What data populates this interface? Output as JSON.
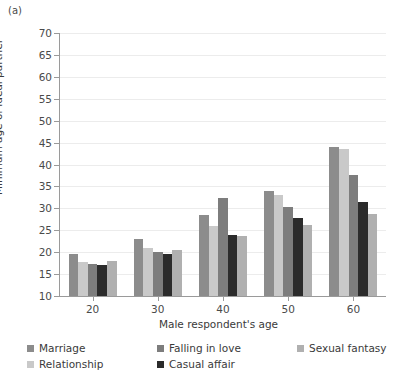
{
  "panel_label": "(a)",
  "chart_data": {
    "type": "bar",
    "title": "",
    "subtitle": "",
    "xlabel": "Male respondent's age",
    "ylabel": "Minimum age of ideal partner",
    "categories": [
      "20",
      "30",
      "40",
      "50",
      "60"
    ],
    "ylim": [
      10,
      70
    ],
    "ytick_step": 5,
    "yticks": [
      10,
      15,
      20,
      25,
      30,
      35,
      40,
      45,
      50,
      55,
      60,
      65,
      70
    ],
    "ytick_labels": [
      "10",
      "15",
      "20",
      "25",
      "30",
      "35",
      "40",
      "45",
      "50",
      "55",
      "60",
      "65",
      "70"
    ],
    "grid": true,
    "grid_axis": "y",
    "legend_position": "bottom-left",
    "legend_columns": 3,
    "series": [
      {
        "name": "Marriage",
        "color": "#8c8c8c",
        "bar_order": 1,
        "values": [
          19.5,
          23.0,
          28.5,
          34.0,
          44.0
        ]
      },
      {
        "name": "Relationship",
        "color": "#c9c9c9",
        "bar_order": 2,
        "values": [
          17.8,
          21.0,
          26.0,
          33.0,
          43.5
        ]
      },
      {
        "name": "Falling in love",
        "color": "#7d7d7d",
        "bar_order": 3,
        "values": [
          17.4,
          20.0,
          32.3,
          30.3,
          37.5
        ]
      },
      {
        "name": "Casual affair",
        "color": "#2b2b2b",
        "bar_order": 4,
        "values": [
          17.0,
          19.5,
          24.0,
          27.8,
          31.5
        ]
      },
      {
        "name": "Sexual fantasy",
        "color": "#b0b0b0",
        "bar_order": 5,
        "values": [
          18.0,
          20.6,
          23.6,
          26.2,
          28.8
        ]
      }
    ],
    "legend_entries": [
      {
        "label": "Marriage",
        "color": "#8c8c8c"
      },
      {
        "label": "Falling in love",
        "color": "#7d7d7d"
      },
      {
        "label": "Sexual fantasy",
        "color": "#b0b0b0"
      },
      {
        "label": "Relationship",
        "color": "#c9c9c9"
      },
      {
        "label": "Casual affair",
        "color": "#2b2b2b"
      }
    ]
  }
}
